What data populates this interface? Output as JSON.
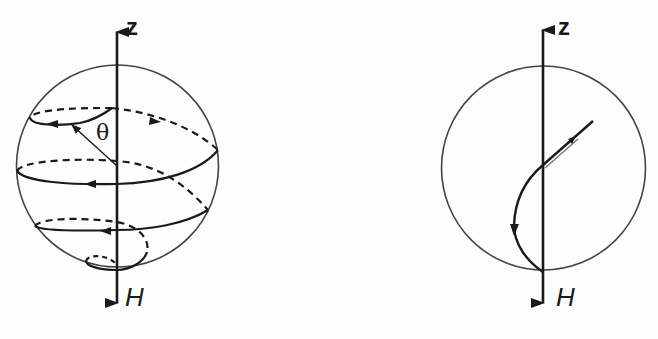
{
  "figure": {
    "panels": [
      {
        "id": "left",
        "description": "Spiral precession of magnetization vector from +z toward field direction H",
        "axis_top_label": "z",
        "axis_bottom_label": "H",
        "angle_label": "θ"
      },
      {
        "id": "right",
        "description": "Direct damped trajectory of magnetization vector toward field direction H",
        "axis_top_label": "z",
        "axis_bottom_label": "H"
      }
    ]
  },
  "colors": {
    "line": "#1a1a1a",
    "sphere_outline": "#444444",
    "background": "#fdfdfd"
  }
}
